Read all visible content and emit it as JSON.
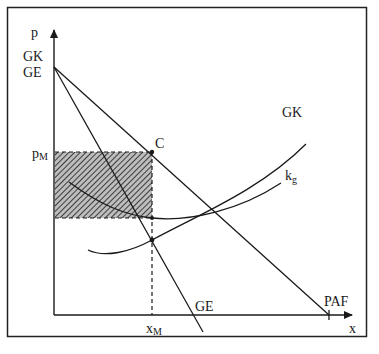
{
  "diagram": {
    "type": "economics-monopoly",
    "axes": {
      "y_label": "p",
      "x_label": "x",
      "y_intercept_labels": [
        "GK",
        "GE"
      ]
    },
    "curves": [
      {
        "id": "paf",
        "label": "PAF",
        "kind": "line",
        "description": "Preis-Absatz-Funktion (demand)"
      },
      {
        "id": "ge",
        "label": "GE",
        "kind": "line",
        "description": "Grenzerlös (marginal revenue)"
      },
      {
        "id": "gk",
        "label": "GK",
        "kind": "curve",
        "description": "Grenzkosten (marginal cost)"
      },
      {
        "id": "kg",
        "label": "k",
        "label_sub": "g",
        "kind": "curve",
        "description": "Durchschnittskosten (average cost)"
      }
    ],
    "points": {
      "c": {
        "label": "C"
      },
      "p_m": {
        "label": "p",
        "sub": "M"
      },
      "x_m": {
        "label": "x",
        "sub": "M"
      }
    },
    "shaded_area": {
      "description": "profit rectangle",
      "pattern": "diagonal-hatch"
    }
  },
  "colors": {
    "line": "#1a1a1a",
    "frame": "#222222",
    "hatch": "#555555",
    "background": "#ffffff"
  }
}
